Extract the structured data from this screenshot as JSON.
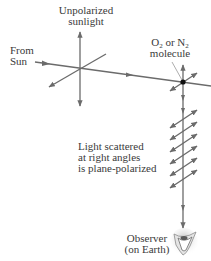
{
  "diagram": {
    "labels": {
      "unpolarized_line1": "Unpolarized",
      "unpolarized_line2": "sunlight",
      "from_sun_line1": "From",
      "from_sun_line2": "Sun",
      "molecule_o": "O",
      "molecule_sub1": "2",
      "molecule_or": " or N",
      "molecule_sub2": "2",
      "molecule_line2": "molecule",
      "scattered_line1": "Light scattered",
      "scattered_line2": "at right angles",
      "scattered_line3": "is plane-polarized",
      "observer_line1": "Observer",
      "observer_line2": "(on Earth)"
    },
    "colors": {
      "line": "#6b6b6b",
      "text": "#3a3a3a",
      "molecule": "#111111",
      "eye": "#8a8a8a"
    },
    "elements": [
      "unpolarized-sunlight-axes",
      "incoming-ray",
      "molecule",
      "scattered-ray",
      "polarization-arrows",
      "observer-eye"
    ]
  }
}
